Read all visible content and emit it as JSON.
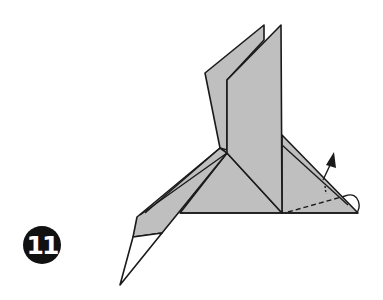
{
  "step": {
    "number": "11"
  },
  "colors": {
    "paper": "#bfbfbf",
    "line": "#1a1a1a",
    "background": "#ffffff",
    "badge": "#111111",
    "beak": "#ffffff"
  },
  "annotations": {
    "arrow": "push-up-arrow",
    "fold_line": "valley-fold-dashed",
    "turn_symbol": "inside-reverse-fold-loop"
  }
}
